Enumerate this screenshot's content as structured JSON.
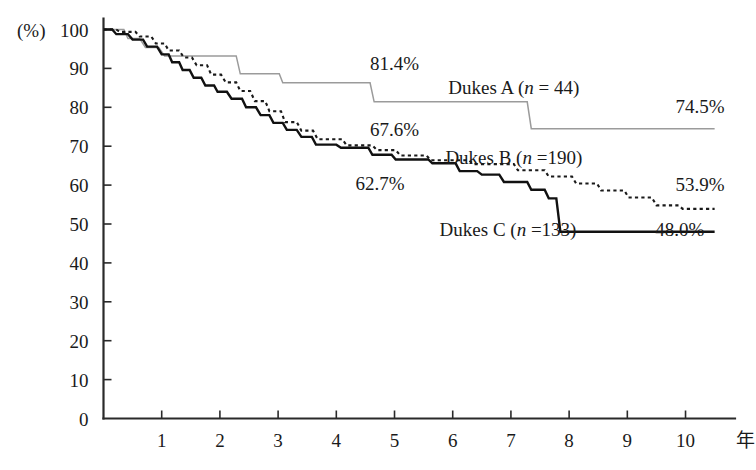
{
  "chart_data": {
    "type": "line",
    "title": "",
    "subtitle": "",
    "xlabel": "年",
    "ylabel": "(%)",
    "xlim": [
      0,
      10.85
    ],
    "ylim": [
      0,
      100
    ],
    "grid": false,
    "legend_position": "inline-annotations",
    "x_ticks": [
      "1",
      "2",
      "3",
      "4",
      "5",
      "6",
      "7",
      "8",
      "9",
      "10"
    ],
    "x_tick_values": [
      1,
      2,
      3,
      4,
      5,
      6,
      7,
      8,
      9,
      10
    ],
    "y_ticks": [
      "0",
      "10",
      "20",
      "30",
      "40",
      "50",
      "60",
      "70",
      "80",
      "90",
      "100"
    ],
    "y_tick_values": [
      0,
      10,
      20,
      30,
      40,
      50,
      60,
      70,
      80,
      90,
      100
    ],
    "series": [
      {
        "name": "Dukes A",
        "label": "Dukes  A (n = 44)",
        "n": 44,
        "style": "thin-gray-step",
        "color": "#9b9b9b",
        "endpoint_value": 74.5,
        "endpoint_label": "74.5%",
        "midpoint_label": "81.4%",
        "midpoint_value": 81.4,
        "points": [
          [
            0.0,
            100.0
          ],
          [
            0.35,
            100.0
          ],
          [
            0.42,
            97.7
          ],
          [
            0.62,
            97.7
          ],
          [
            0.72,
            95.4
          ],
          [
            0.95,
            95.4
          ],
          [
            1.05,
            93.2
          ],
          [
            2.28,
            93.2
          ],
          [
            2.35,
            88.6
          ],
          [
            3.02,
            88.6
          ],
          [
            3.08,
            86.3
          ],
          [
            4.58,
            86.3
          ],
          [
            4.65,
            81.4
          ],
          [
            7.28,
            81.4
          ],
          [
            7.35,
            74.5
          ],
          [
            10.5,
            74.5
          ]
        ]
      },
      {
        "name": "Dukes B",
        "label": "Dukes  B (n =190)",
        "n": 190,
        "style": "dotted-black-step",
        "color": "#1a1a1a",
        "endpoint_value": 53.9,
        "endpoint_label": "53.9%",
        "midpoint_label": "67.6%",
        "midpoint_value": 67.6,
        "points": [
          [
            0.0,
            100.0
          ],
          [
            0.22,
            100.0
          ],
          [
            0.28,
            99.4
          ],
          [
            0.55,
            99.4
          ],
          [
            0.62,
            98.2
          ],
          [
            0.82,
            98.2
          ],
          [
            0.9,
            96.4
          ],
          [
            1.05,
            96.4
          ],
          [
            1.12,
            94.6
          ],
          [
            1.3,
            94.6
          ],
          [
            1.38,
            92.8
          ],
          [
            1.52,
            92.8
          ],
          [
            1.6,
            90.8
          ],
          [
            1.78,
            90.8
          ],
          [
            1.85,
            88.4
          ],
          [
            2.02,
            88.4
          ],
          [
            2.1,
            86.4
          ],
          [
            2.28,
            86.4
          ],
          [
            2.35,
            84.2
          ],
          [
            2.52,
            84.2
          ],
          [
            2.6,
            81.6
          ],
          [
            2.78,
            81.6
          ],
          [
            2.85,
            79.0
          ],
          [
            3.05,
            79.0
          ],
          [
            3.12,
            76.2
          ],
          [
            3.32,
            76.2
          ],
          [
            3.4,
            74.0
          ],
          [
            3.6,
            74.0
          ],
          [
            3.68,
            71.8
          ],
          [
            4.1,
            71.8
          ],
          [
            4.18,
            70.2
          ],
          [
            4.62,
            70.2
          ],
          [
            4.7,
            69.0
          ],
          [
            5.02,
            69.0
          ],
          [
            5.1,
            67.6
          ],
          [
            5.55,
            67.6
          ],
          [
            5.62,
            66.4
          ],
          [
            6.28,
            66.4
          ],
          [
            6.35,
            65.4
          ],
          [
            7.05,
            65.4
          ],
          [
            7.12,
            63.8
          ],
          [
            7.58,
            63.8
          ],
          [
            7.65,
            62.2
          ],
          [
            8.05,
            62.2
          ],
          [
            8.12,
            60.4
          ],
          [
            8.48,
            60.4
          ],
          [
            8.55,
            58.6
          ],
          [
            8.95,
            58.6
          ],
          [
            9.02,
            56.8
          ],
          [
            9.42,
            56.8
          ],
          [
            9.5,
            54.8
          ],
          [
            9.88,
            54.8
          ],
          [
            9.95,
            53.9
          ],
          [
            10.5,
            53.9
          ]
        ]
      },
      {
        "name": "Dukes C",
        "label": "Dukes  C (n =133)",
        "n": 133,
        "style": "solid-black-step",
        "color": "#111111",
        "endpoint_value": 48.0,
        "endpoint_label": "48.0%",
        "midpoint_label": "62.7%",
        "midpoint_value": 62.7,
        "points": [
          [
            0.0,
            100.0
          ],
          [
            0.15,
            100.0
          ],
          [
            0.22,
            98.8
          ],
          [
            0.42,
            98.8
          ],
          [
            0.5,
            97.4
          ],
          [
            0.68,
            97.4
          ],
          [
            0.75,
            95.6
          ],
          [
            0.92,
            95.6
          ],
          [
            1.0,
            93.6
          ],
          [
            1.12,
            93.6
          ],
          [
            1.18,
            91.6
          ],
          [
            1.3,
            91.6
          ],
          [
            1.36,
            89.6
          ],
          [
            1.48,
            89.6
          ],
          [
            1.55,
            87.6
          ],
          [
            1.68,
            87.6
          ],
          [
            1.75,
            85.6
          ],
          [
            1.9,
            85.6
          ],
          [
            1.96,
            84.0
          ],
          [
            2.12,
            84.0
          ],
          [
            2.2,
            82.2
          ],
          [
            2.38,
            82.2
          ],
          [
            2.45,
            80.0
          ],
          [
            2.62,
            80.0
          ],
          [
            2.7,
            78.0
          ],
          [
            2.85,
            78.0
          ],
          [
            2.92,
            76.0
          ],
          [
            3.08,
            76.0
          ],
          [
            3.15,
            74.2
          ],
          [
            3.32,
            74.2
          ],
          [
            3.4,
            72.4
          ],
          [
            3.58,
            72.4
          ],
          [
            3.65,
            70.4
          ],
          [
            4.0,
            70.4
          ],
          [
            4.08,
            69.6
          ],
          [
            4.55,
            69.6
          ],
          [
            4.62,
            67.8
          ],
          [
            4.95,
            67.8
          ],
          [
            5.02,
            66.6
          ],
          [
            5.58,
            66.6
          ],
          [
            5.65,
            65.6
          ],
          [
            6.05,
            65.6
          ],
          [
            6.12,
            63.6
          ],
          [
            6.42,
            63.6
          ],
          [
            6.5,
            62.7
          ],
          [
            6.8,
            62.7
          ],
          [
            6.88,
            60.8
          ],
          [
            7.28,
            60.8
          ],
          [
            7.35,
            58.8
          ],
          [
            7.58,
            58.8
          ],
          [
            7.65,
            56.6
          ],
          [
            7.78,
            56.6
          ],
          [
            7.85,
            48.0
          ],
          [
            10.5,
            48.0
          ]
        ]
      }
    ],
    "annotations": [
      {
        "text": "81.4%",
        "x": 5.0,
        "y": 89.5,
        "name": "annotation-dukes-a-midpoint"
      },
      {
        "text": "Dukes  A (n = 44)",
        "x": 7.05,
        "y": 83.5,
        "name": "annotation-dukes-a-label"
      },
      {
        "text": "74.5%",
        "x": 10.25,
        "y": 78.5,
        "name": "annotation-dukes-a-endpoint"
      },
      {
        "text": "67.6%",
        "x": 5.0,
        "y": 72.6,
        "name": "annotation-dukes-b-midpoint"
      },
      {
        "text": "Dukes  B (n =190)",
        "x": 7.05,
        "y": 65.5,
        "name": "annotation-dukes-b-label"
      },
      {
        "text": "53.9%",
        "x": 10.25,
        "y": 58.5,
        "name": "annotation-dukes-b-endpoint"
      },
      {
        "text": "62.7%",
        "x": 4.75,
        "y": 58.8,
        "name": "annotation-dukes-c-midpoint"
      },
      {
        "text": "Dukes  C (n =133)",
        "x": 6.95,
        "y": 47.0,
        "name": "annotation-dukes-c-label"
      },
      {
        "text": "48.0%",
        "x": 9.9,
        "y": 47.0,
        "name": "annotation-dukes-c-endpoint"
      }
    ]
  },
  "axes": {
    "y_unit": "(%)",
    "x_unit": "年"
  }
}
